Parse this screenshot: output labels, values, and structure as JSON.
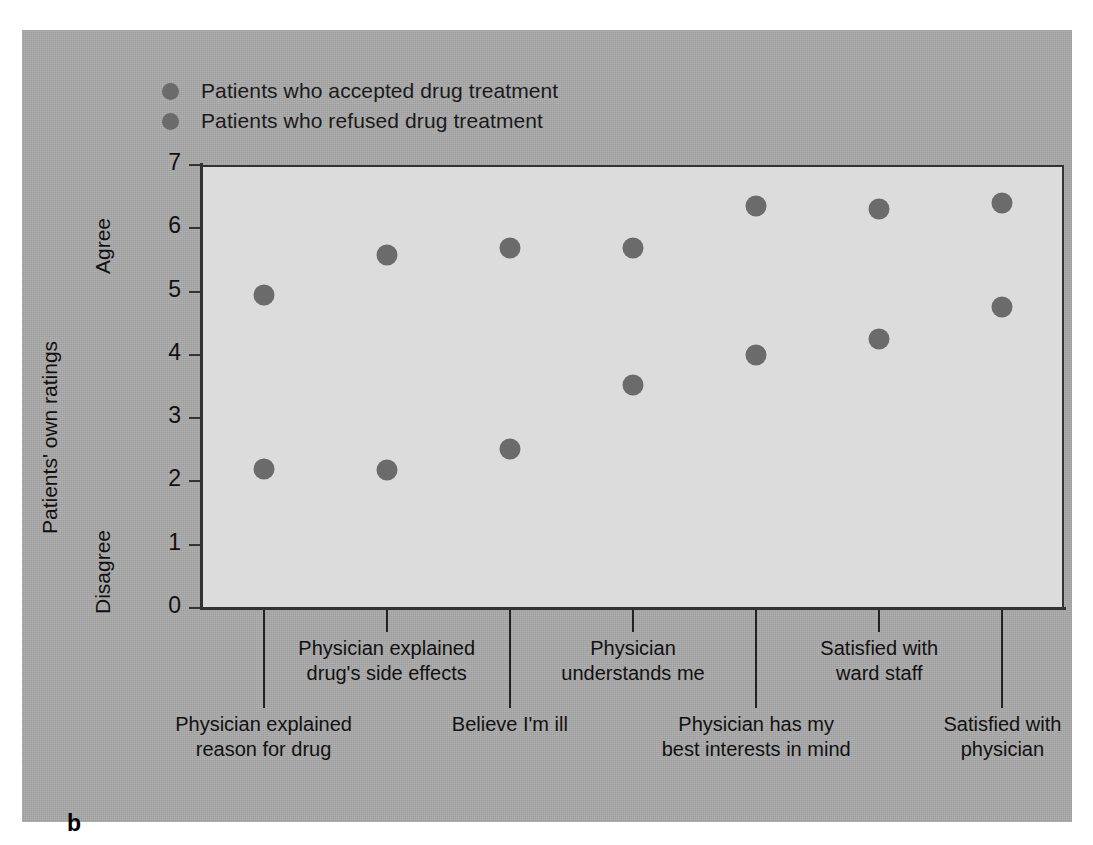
{
  "panel": {
    "letter": "b"
  },
  "legend": {
    "items": [
      {
        "label": "Patients who accepted drug treatment",
        "color": "#6b6b6b",
        "marker": "circle-marker"
      },
      {
        "label": "Patients who refused drug treatment",
        "color": "#6b6b6b",
        "marker": "circle-marker"
      }
    ]
  },
  "axes": {
    "y_label": "Patients' own ratings",
    "y_top_word": "Agree",
    "y_bottom_word": "Disagree",
    "y_ticks": [
      "0",
      "1",
      "2",
      "3",
      "4",
      "5",
      "6",
      "7"
    ]
  },
  "chart_data": {
    "type": "scatter",
    "title": "",
    "xlabel": "",
    "ylabel": "Patients' own ratings",
    "ylim": [
      0,
      7
    ],
    "ytick_values": [
      0,
      1,
      2,
      3,
      4,
      5,
      6,
      7
    ],
    "grid": false,
    "legend_position": "top-left",
    "y_scale_anchors": {
      "low": "Disagree",
      "high": "Agree"
    },
    "categories": [
      "Physician explained reason for drug",
      "Physician explained drug's side effects",
      "Believe I'm ill",
      "Physician understands me",
      "Physician has my best interests in mind",
      "Satisfied with ward staff",
      "Satisfied with physician"
    ],
    "series": [
      {
        "name": "Patients who accepted drug treatment",
        "color": "#6b6b6b",
        "values": [
          4.95,
          5.58,
          5.69,
          5.69,
          6.35,
          6.3,
          6.4
        ]
      },
      {
        "name": "Patients who refused drug treatment",
        "color": "#6b6b6b",
        "values": [
          2.2,
          2.18,
          2.51,
          3.53,
          3.99,
          4.25,
          4.75
        ]
      }
    ]
  },
  "category_labels": [
    {
      "lines": [
        "Physician explained",
        "reason for drug"
      ],
      "row": "lower"
    },
    {
      "lines": [
        "Physician explained",
        "drug's side effects"
      ],
      "row": "upper"
    },
    {
      "lines": [
        "Believe I'm ill"
      ],
      "row": "lower"
    },
    {
      "lines": [
        "Physician",
        "understands me"
      ],
      "row": "upper"
    },
    {
      "lines": [
        "Physician has my",
        "best interests in mind"
      ],
      "row": "lower"
    },
    {
      "lines": [
        "Satisfied with",
        "ward staff"
      ],
      "row": "upper"
    },
    {
      "lines": [
        "Satisfied with",
        "physician"
      ],
      "row": "lower"
    }
  ]
}
